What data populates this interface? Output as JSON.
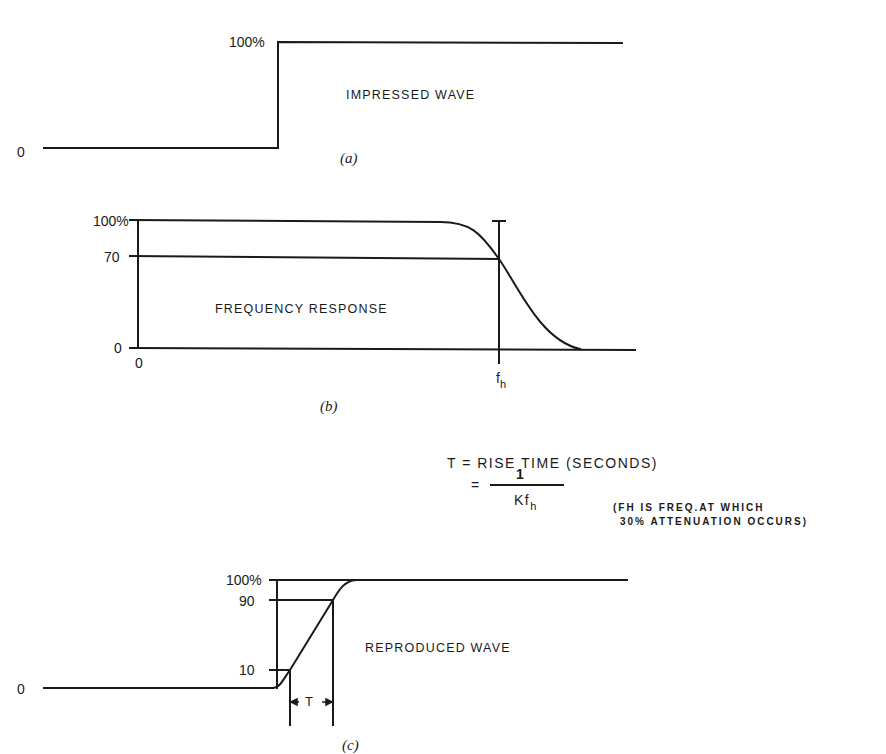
{
  "panel_a": {
    "label_100": "100%",
    "label_0": "0",
    "title": "IMPRESSED  WAVE",
    "caption": "(a)"
  },
  "panel_b": {
    "label_100": "100%",
    "label_70": "70",
    "label_0_y": "0",
    "label_0_x": "0",
    "fh_main": "f",
    "fh_sub": "h",
    "title": "FREQUENCY RESPONSE",
    "caption": "(b)"
  },
  "formula": {
    "line1": "T = RISE TIME (SECONDS)",
    "eq": "=",
    "numerator": "1",
    "denom_main": "Kf",
    "denom_sub": "h",
    "note_line1": "(FH IS FREQ.AT WHICH",
    "note_line2": "30% ATTENUATION OCCURS)"
  },
  "panel_c": {
    "label_100": "100%",
    "label_90": "90",
    "label_10": "10",
    "label_0": "0",
    "t_label": "T",
    "title": "REPRODUCED  WAVE",
    "caption": "(c)"
  },
  "colors": {
    "ink": "#1a1a1a",
    "background": "#ffffff"
  }
}
